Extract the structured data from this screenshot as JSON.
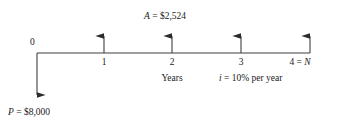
{
  "diagram": {
    "type": "cash-flow-timeline",
    "background_color": "#ffffff",
    "line_color": "#3f3f3f",
    "text_color": "#1a1a1a",
    "origin_label": "0",
    "time_axis_label": "Years",
    "interest_label": "i = 10% per year",
    "interest_symbol": "i",
    "interest_rate": "10%",
    "interest_period": "per year",
    "annuity_label": "A = $2,524",
    "annuity_symbol": "A",
    "annuity_value": "$2,524",
    "principal_label": "P = $8,000",
    "principal_symbol": "P",
    "principal_value": "$8,000",
    "horizon_label": "4 = N",
    "horizon_symbol": "N",
    "horizon_period": "4",
    "tick_labels": [
      "0",
      "1",
      "2",
      "3",
      "4"
    ],
    "inflows": [
      {
        "period": "1",
        "value": "$2,524",
        "direction": "up"
      },
      {
        "period": "2",
        "value": "$2,524",
        "direction": "up"
      },
      {
        "period": "3",
        "value": "$2,524",
        "direction": "up"
      },
      {
        "period": "4",
        "value": "$2,524",
        "direction": "up"
      }
    ],
    "outflows": [
      {
        "period": "0",
        "value": "$8,000",
        "direction": "down"
      }
    ]
  }
}
